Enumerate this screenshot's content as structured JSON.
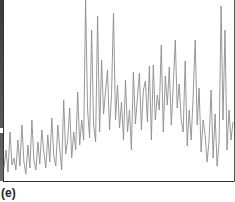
{
  "panel": {
    "label": "(e)"
  },
  "style": {
    "line_color": "#8c8c8c",
    "axis_color": "#333333",
    "frame_color": "#555555",
    "background": "#ffffff"
  },
  "chart_data": {
    "type": "line",
    "title": "",
    "xlabel": "",
    "ylabel": "",
    "grid": false,
    "legend": null,
    "annotations": [
      "(e)"
    ],
    "xlim": [
      0,
      230
    ],
    "ylim": [
      0,
      180
    ],
    "series": [
      {
        "name": "signal",
        "x": [
          0,
          2,
          4,
          6,
          8,
          10,
          12,
          14,
          16,
          18,
          20,
          22,
          24,
          26,
          28,
          30,
          32,
          34,
          36,
          38,
          40,
          42,
          44,
          46,
          48,
          50,
          52,
          54,
          56,
          58,
          60,
          62,
          64,
          66,
          68,
          70,
          72,
          74,
          76,
          78,
          80,
          82,
          84,
          86,
          88,
          90,
          92,
          94,
          96,
          98,
          100,
          102,
          104,
          106,
          108,
          110,
          112,
          114,
          116,
          118,
          120,
          122,
          124,
          126,
          128,
          130,
          132,
          134,
          136,
          138,
          140,
          142,
          144,
          146,
          148,
          150,
          152,
          154,
          156,
          158,
          160,
          162,
          164,
          166,
          168,
          170,
          172,
          174,
          176,
          178,
          180,
          182,
          184,
          186,
          188,
          190,
          192,
          194,
          196,
          198,
          200,
          202,
          204,
          206,
          208,
          210,
          212,
          214,
          216,
          218,
          220,
          222,
          224,
          226,
          228,
          230
        ],
        "values": [
          12,
          30,
          8,
          48,
          15,
          22,
          10,
          40,
          14,
          55,
          18,
          6,
          35,
          12,
          60,
          20,
          10,
          38,
          16,
          50,
          28,
          12,
          45,
          18,
          62,
          24,
          14,
          55,
          30,
          10,
          80,
          26,
          40,
          72,
          22,
          48,
          30,
          88,
          35,
          60,
          40,
          180,
          70,
          42,
          150,
          55,
          38,
          164,
          48,
          120,
          66,
          90,
          110,
          50,
          85,
          167,
          60,
          95,
          52,
          78,
          40,
          100,
          48,
          70,
          30,
          108,
          56,
          82,
          107,
          50,
          90,
          99,
          58,
          114,
          40,
          115,
          60,
          85,
          70,
          135,
          48,
          104,
          75,
          113,
          55,
          95,
          140,
          72,
          96,
          60,
          48,
          119,
          34,
          70,
          40,
          85,
          140,
          55,
          92,
          28,
          60,
          45,
          18,
          40,
          90,
          22,
          66,
          14,
          38,
          174,
          60,
          150,
          30,
          70,
          40,
          58
        ]
      }
    ]
  }
}
